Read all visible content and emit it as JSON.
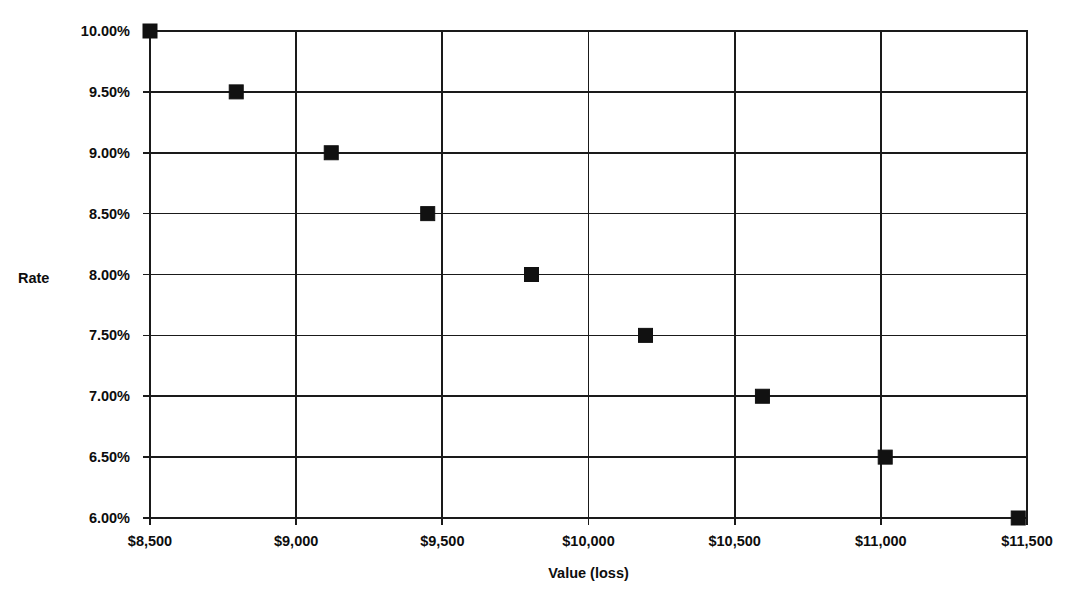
{
  "chart_data": {
    "type": "scatter",
    "title": "",
    "xlabel": "Value (loss)",
    "ylabel": "Rate",
    "xlim": [
      8500,
      11500
    ],
    "ylim": [
      6.0,
      10.0
    ],
    "grid": true,
    "legend": "none",
    "x_tick_labels": [
      "$8,500",
      "$9,000",
      "$9,500",
      "$10,000",
      "$10,500",
      "$11,000",
      "$11,500"
    ],
    "x_tick_values": [
      8500,
      9000,
      9500,
      10000,
      10500,
      11000,
      11500
    ],
    "y_tick_labels": [
      "10.00%",
      "9.50%",
      "9.00%",
      "8.50%",
      "8.00%",
      "7.50%",
      "7.00%",
      "6.50%",
      "6.00%"
    ],
    "y_tick_values": [
      10.0,
      9.5,
      9.0,
      8.5,
      8.0,
      7.5,
      7.0,
      6.5,
      6.0
    ],
    "marker": {
      "shape": "square",
      "color": "#111111",
      "size_px": 14
    },
    "series": [
      {
        "name": "Rate vs Value (loss)",
        "points": [
          {
            "x": 8500,
            "y": 10.0
          },
          {
            "x": 8795,
            "y": 9.5
          },
          {
            "x": 9120,
            "y": 9.0
          },
          {
            "x": 9450,
            "y": 8.5
          },
          {
            "x": 9805,
            "y": 8.0
          },
          {
            "x": 10195,
            "y": 7.5
          },
          {
            "x": 10595,
            "y": 7.0
          },
          {
            "x": 11015,
            "y": 6.5
          },
          {
            "x": 11470,
            "y": 6.0
          }
        ]
      }
    ]
  },
  "geometry": {
    "plot_left": 150,
    "plot_right": 1027,
    "plot_top": 31,
    "plot_bottom": 518,
    "y_label_x": 130,
    "y_label_dy": 5,
    "x_label_y": 546,
    "x_axis_title_y": 578,
    "y_axis_title_x": 18,
    "y_axis_title_y": 283,
    "tick_len": 7
  }
}
